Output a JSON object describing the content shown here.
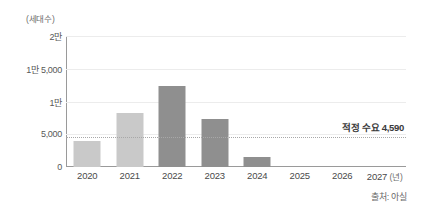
{
  "chart_data": {
    "type": "bar",
    "title": "",
    "unit_caption": "(세대수)",
    "xlabel_suffix": "(년)",
    "ylabel": "",
    "ylim": [
      0,
      20000
    ],
    "grid": true,
    "legend": "none",
    "categories": [
      "2020",
      "2021",
      "2022",
      "2023",
      "2024",
      "2025",
      "2026",
      "2027"
    ],
    "values": [
      4000,
      8200,
      12400,
      7300,
      1500,
      0,
      0,
      0
    ],
    "ytick_labels": [
      "2만",
      "1만 5,000",
      "1만",
      "5,000",
      "0"
    ],
    "ytick_values": [
      20000,
      15000,
      10000,
      5000,
      0
    ],
    "bar_colors": [
      "#c9c9c9",
      "#c9c9c9",
      "#8f8f8f",
      "#8f8f8f",
      "#8f8f8f",
      "#8f8f8f",
      "#8f8f8f",
      "#8f8f8f"
    ],
    "annotations": [
      {
        "name": "target-demand",
        "label": "적정 수요 4,590",
        "value": 4590,
        "style": "dotted-horizontal-line"
      }
    ]
  },
  "source": {
    "text": "출처: 아실"
  }
}
